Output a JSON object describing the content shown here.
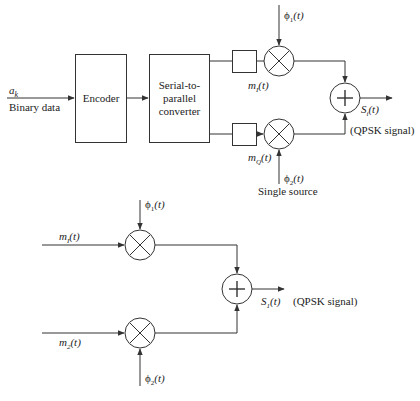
{
  "top_diagram": {
    "input": {
      "symbol": "a_k",
      "symbol_main": "a",
      "symbol_sub": "k",
      "label": "Binary data"
    },
    "encoder_label": "Encoder",
    "converter_label": [
      "Serial-to-",
      "parallel",
      "converter"
    ],
    "phi1": {
      "main": "ϕ",
      "sub": "1",
      "arg": "(t)"
    },
    "phi2": {
      "main": "ϕ",
      "sub": "2",
      "arg": "(t)"
    },
    "mI": {
      "main": "m",
      "sub": "I",
      "arg": "(t)"
    },
    "mQ": {
      "main": "m",
      "sub": "Q",
      "arg": "(t)"
    },
    "output": {
      "main": "S",
      "sub": "i",
      "arg": "(t)"
    },
    "output_note": "(QPSK signal)",
    "source_note": "Single source",
    "multiplier_symbol": "×",
    "adder_symbol": "+"
  },
  "bottom_diagram": {
    "phi1": {
      "main": "ϕ",
      "sub": "1",
      "arg": "(t)"
    },
    "phi2": {
      "main": "ϕ",
      "sub": "2",
      "arg": "(t)"
    },
    "m1": {
      "main": "m",
      "sub": "I",
      "arg": "(t)"
    },
    "m2": {
      "main": "m",
      "sub": "2",
      "arg": "(t)"
    },
    "output": {
      "main": "S",
      "sub": "1",
      "arg": "(t)"
    },
    "output_note": "(QPSK signal)",
    "multiplier_symbol": "×",
    "adder_symbol": "+"
  },
  "colors": {
    "stroke": "#333333",
    "text": "#222222",
    "background": "#ffffff"
  }
}
